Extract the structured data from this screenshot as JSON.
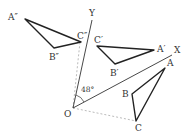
{
  "diagram": {
    "title": "",
    "colors": {
      "line": "#222222",
      "axis": "#333333",
      "dashed": "#aaaaaa",
      "text": "#333333"
    },
    "origin": {
      "label": "O"
    },
    "axes": [
      {
        "label": "X"
      },
      {
        "label": "Y"
      }
    ],
    "angle": {
      "label": "48°"
    },
    "triangles": [
      {
        "name": "ABC",
        "vertices": [
          "A",
          "B",
          "C"
        ]
      },
      {
        "name": "A'B'C'",
        "vertices": [
          "A′",
          "B′",
          "C′"
        ]
      },
      {
        "name": "A''B''C''",
        "vertices": [
          "A″",
          "B″",
          "C″"
        ]
      }
    ]
  }
}
